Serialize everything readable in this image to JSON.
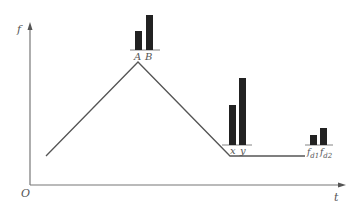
{
  "axes": {
    "y_label": "f",
    "x_label": "t",
    "origin_label": "O"
  },
  "groups": [
    {
      "labels": [
        "A",
        "B"
      ],
      "position": "peak"
    },
    {
      "labels": [
        "x",
        "y"
      ],
      "position": "valley-start"
    },
    {
      "labels": [
        "f",
        "f"
      ],
      "subscripts": [
        "d1",
        "d2"
      ],
      "position": "plateau-end"
    }
  ],
  "colors": {
    "line": "#555555",
    "bar": "#222222",
    "axis": "#777777"
  }
}
